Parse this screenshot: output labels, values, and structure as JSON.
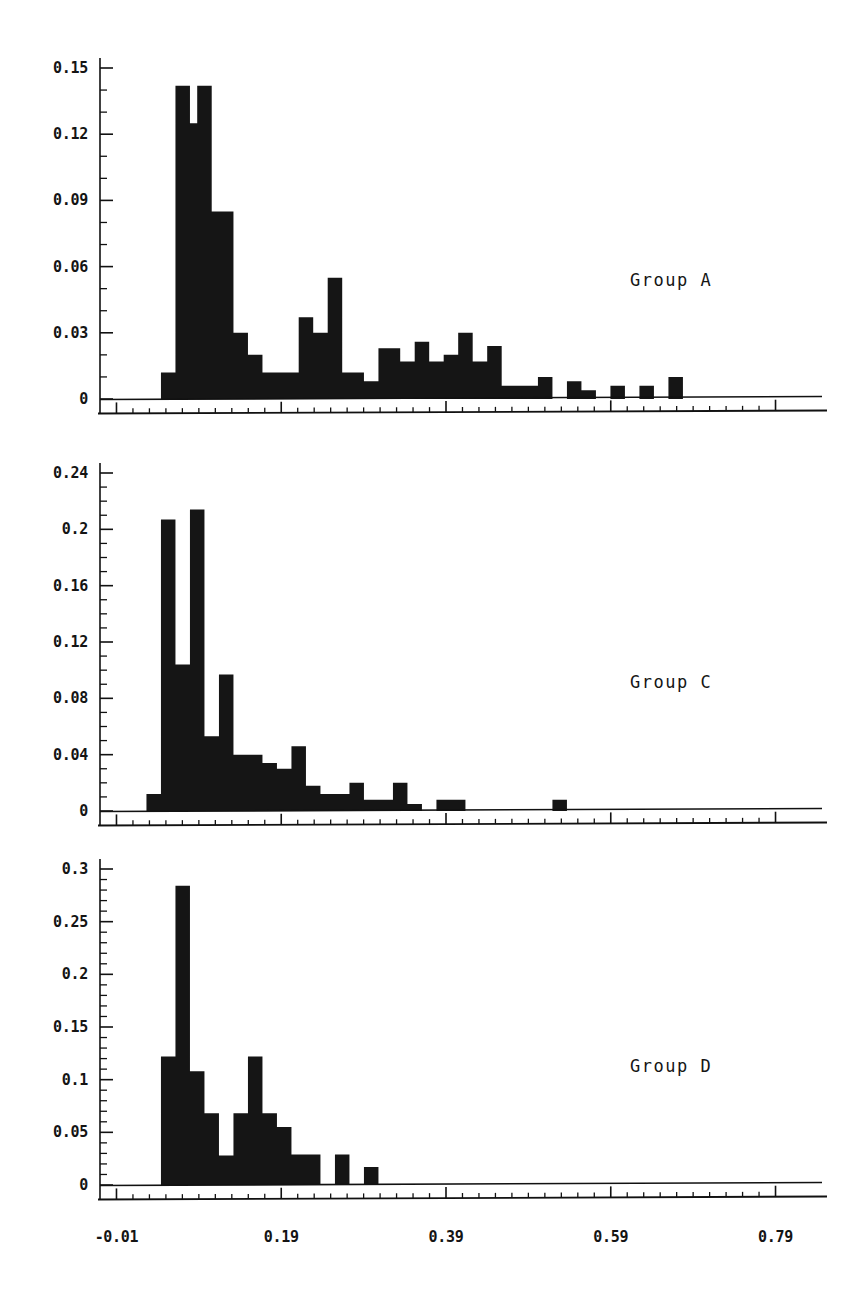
{
  "figure": {
    "title": "",
    "background": "#ffffff",
    "ink_color": "#151515",
    "panel_count": 3
  },
  "xaxis": {
    "tick_labels": [
      "-0.01",
      "0.19",
      "0.39",
      "0.59",
      "0.79"
    ],
    "tick_values": [
      -0.01,
      0.19,
      0.39,
      0.59,
      0.79
    ],
    "minor_step": 0.02,
    "range": [
      -0.03,
      0.81
    ],
    "label": ""
  },
  "panels": [
    {
      "name": "Group A",
      "group_label": "Group A",
      "ylabels": [
        "0.15",
        "0.12",
        "0.09",
        "0.06",
        "0.03",
        "0"
      ],
      "yvalues": [
        0.15,
        0.12,
        0.09,
        0.06,
        0.03,
        0
      ],
      "ylim": [
        0,
        0.158
      ],
      "minor_per_major": 3
    },
    {
      "name": "Group C",
      "group_label": "Group C",
      "ylabels": [
        "0.24",
        "0.2",
        "0.16",
        "0.12",
        "0.08",
        "0.04",
        "0"
      ],
      "yvalues": [
        0.24,
        0.2,
        0.16,
        0.12,
        0.08,
        0.04,
        0
      ],
      "ylim": [
        0,
        0.255
      ],
      "minor_per_major": 4
    },
    {
      "name": "Group D",
      "group_label": "Group D",
      "ylabels": [
        "0.3",
        "0.25",
        "0.2",
        "0.15",
        "0.1",
        "0.05",
        "0"
      ],
      "yvalues": [
        0.3,
        0.25,
        0.2,
        0.15,
        0.1,
        0.05,
        0
      ],
      "ylim": [
        0,
        0.315
      ],
      "minor_per_major": 5
    }
  ],
  "chart_data": [
    {
      "type": "bar",
      "title": "Group A",
      "xlabel": "",
      "ylabel": "",
      "xlim": [
        -0.03,
        0.81
      ],
      "ylim": [
        0,
        0.158
      ],
      "grid": false,
      "legend": "none",
      "annotation": "Group A",
      "bin_width": 0.0088,
      "bin_starts": [
        0.0088,
        0.0176,
        0.0264,
        0.0352,
        0.044,
        0.0528,
        0.0616,
        0.0704,
        0.0792,
        0.088,
        0.0968,
        0.1056,
        0.1144,
        0.1232,
        0.132,
        0.1408,
        0.1496,
        0.1584,
        0.1672,
        0.176,
        0.1848,
        0.1936,
        0.2024,
        0.2112,
        0.22,
        0.2288,
        0.2376,
        0.2464,
        0.2552,
        0.264,
        0.2728,
        0.2816,
        0.2904,
        0.2992,
        0.308,
        0.3168,
        0.3256,
        0.3344,
        0.3432,
        0.352,
        0.3608,
        0.3696,
        0.3784,
        0.3872,
        0.396,
        0.4048,
        0.4136,
        0.4224,
        0.4312,
        0.44,
        0.4488,
        0.4576,
        0.4664,
        0.4752,
        0.484,
        0.4928,
        0.5016,
        0.5104,
        0.5192,
        0.528,
        0.5368,
        0.5456,
        0.5544,
        0.5632,
        0.572,
        0.5808,
        0.5896,
        0.5984,
        0.6072,
        0.616,
        0.6248,
        0.6336,
        0.6424,
        0.6512,
        0.66,
        0.6688,
        0.6776,
        0.6864,
        0.6952,
        0.704,
        0.7128,
        0.7216,
        0.7304,
        0.7392
      ],
      "values": [
        0.0,
        0.0,
        0.0,
        0.0,
        0.012,
        0.012,
        0.142,
        0.142,
        0.125,
        0.142,
        0.142,
        0.085,
        0.085,
        0.085,
        0.03,
        0.03,
        0.02,
        0.02,
        0.012,
        0.012,
        0.012,
        0.012,
        0.012,
        0.037,
        0.037,
        0.03,
        0.03,
        0.055,
        0.055,
        0.012,
        0.012,
        0.012,
        0.008,
        0.008,
        0.023,
        0.023,
        0.023,
        0.017,
        0.017,
        0.026,
        0.026,
        0.017,
        0.017,
        0.02,
        0.02,
        0.03,
        0.03,
        0.017,
        0.017,
        0.024,
        0.024,
        0.006,
        0.006,
        0.006,
        0.006,
        0.006,
        0.01,
        0.01,
        0.0,
        0.0,
        0.008,
        0.008,
        0.004,
        0.004,
        0.0,
        0.0,
        0.006,
        0.006,
        0.0,
        0.0,
        0.006,
        0.006,
        0.0,
        0.0,
        0.01,
        0.01,
        0.0,
        0.0,
        0.0,
        0.0,
        0.0,
        0.0,
        0.0,
        0.0
      ]
    },
    {
      "type": "bar",
      "title": "Group C",
      "xlabel": "",
      "ylabel": "",
      "xlim": [
        -0.03,
        0.81
      ],
      "ylim": [
        0,
        0.255
      ],
      "grid": false,
      "legend": "none",
      "annotation": "Group C",
      "bin_width": 0.0088,
      "bin_starts": [
        0.0088,
        0.0176,
        0.0264,
        0.0352,
        0.044,
        0.0528,
        0.0616,
        0.0704,
        0.0792,
        0.088,
        0.0968,
        0.1056,
        0.1144,
        0.1232,
        0.132,
        0.1408,
        0.1496,
        0.1584,
        0.1672,
        0.176,
        0.1848,
        0.1936,
        0.2024,
        0.2112,
        0.22,
        0.2288,
        0.2376,
        0.2464,
        0.2552,
        0.264,
        0.2728,
        0.2816,
        0.2904,
        0.2992,
        0.308,
        0.3168,
        0.3256,
        0.3344,
        0.3432,
        0.352,
        0.3608,
        0.3696,
        0.3784,
        0.3872,
        0.396,
        0.4048,
        0.4136,
        0.4224,
        0.4312,
        0.44,
        0.4488,
        0.4576,
        0.4664,
        0.4752,
        0.484,
        0.4928,
        0.5016,
        0.5104,
        0.5192,
        0.528,
        0.5368,
        0.5456,
        0.5544,
        0.5632,
        0.572,
        0.5808,
        0.5896,
        0.5984,
        0.6072,
        0.616,
        0.6248,
        0.6336,
        0.6424,
        0.6512,
        0.66,
        0.6688,
        0.6776,
        0.6864,
        0.6952,
        0.704,
        0.7128,
        0.7216,
        0.7304,
        0.7392
      ],
      "values": [
        0.0,
        0.0,
        0.012,
        0.012,
        0.207,
        0.207,
        0.104,
        0.104,
        0.214,
        0.214,
        0.053,
        0.053,
        0.097,
        0.097,
        0.04,
        0.04,
        0.04,
        0.04,
        0.034,
        0.034,
        0.03,
        0.03,
        0.046,
        0.046,
        0.018,
        0.018,
        0.012,
        0.012,
        0.012,
        0.012,
        0.02,
        0.02,
        0.008,
        0.008,
        0.008,
        0.008,
        0.02,
        0.02,
        0.005,
        0.005,
        0.0,
        0.0,
        0.008,
        0.008,
        0.008,
        0.008,
        0.0,
        0.0,
        0.0,
        0.0,
        0.0,
        0.0,
        0.0,
        0.0,
        0.0,
        0.0,
        0.0,
        0.0,
        0.008,
        0.008,
        0.0,
        0.0,
        0.0,
        0.0,
        0.0,
        0.0,
        0.0,
        0.0,
        0.0,
        0.0,
        0.0,
        0.0,
        0.0,
        0.0,
        0.0,
        0.0,
        0.0,
        0.0,
        0.0,
        0.0,
        0.0,
        0.0,
        0.0,
        0.0
      ]
    },
    {
      "type": "bar",
      "title": "Group D",
      "xlabel": "",
      "ylabel": "",
      "xlim": [
        -0.03,
        0.81
      ],
      "ylim": [
        0,
        0.315
      ],
      "grid": false,
      "legend": "none",
      "annotation": "Group D",
      "bin_width": 0.0088,
      "bin_starts": [
        0.0088,
        0.0176,
        0.0264,
        0.0352,
        0.044,
        0.0528,
        0.0616,
        0.0704,
        0.0792,
        0.088,
        0.0968,
        0.1056,
        0.1144,
        0.1232,
        0.132,
        0.1408,
        0.1496,
        0.1584,
        0.1672,
        0.176,
        0.1848,
        0.1936,
        0.2024,
        0.2112,
        0.22,
        0.2288,
        0.2376,
        0.2464,
        0.2552,
        0.264,
        0.2728,
        0.2816,
        0.2904,
        0.2992,
        0.308,
        0.3168,
        0.3256,
        0.3344,
        0.3432,
        0.352,
        0.3608,
        0.3696,
        0.3784,
        0.3872,
        0.396,
        0.4048,
        0.4136,
        0.4224,
        0.4312,
        0.44,
        0.4488,
        0.4576,
        0.4664,
        0.4752,
        0.484,
        0.4928,
        0.5016,
        0.5104,
        0.5192,
        0.528,
        0.5368,
        0.5456,
        0.5544,
        0.5632,
        0.572,
        0.5808,
        0.5896,
        0.5984,
        0.6072,
        0.616,
        0.6248,
        0.6336,
        0.6424,
        0.6512,
        0.66,
        0.6688,
        0.6776,
        0.6864,
        0.6952,
        0.704,
        0.7128,
        0.7216,
        0.7304,
        0.7392
      ],
      "values": [
        0.0,
        0.0,
        0.0,
        0.0,
        0.122,
        0.122,
        0.284,
        0.284,
        0.108,
        0.108,
        0.068,
        0.068,
        0.028,
        0.028,
        0.068,
        0.068,
        0.122,
        0.122,
        0.068,
        0.068,
        0.055,
        0.055,
        0.029,
        0.029,
        0.029,
        0.029,
        0.0,
        0.0,
        0.029,
        0.029,
        0.0,
        0.0,
        0.017,
        0.017,
        0.0,
        0.0,
        0.0,
        0.0,
        0.0,
        0.0,
        0.0,
        0.0,
        0.0,
        0.0,
        0.0,
        0.0,
        0.0,
        0.0,
        0.0,
        0.0,
        0.0,
        0.0,
        0.0,
        0.0,
        0.0,
        0.0,
        0.0,
        0.0,
        0.0,
        0.0,
        0.0,
        0.0,
        0.0,
        0.0,
        0.0,
        0.0,
        0.0,
        0.0,
        0.0,
        0.0,
        0.0,
        0.0,
        0.0,
        0.0,
        0.0,
        0.0,
        0.0,
        0.0,
        0.0,
        0.0,
        0.0,
        0.0,
        0.0,
        0.0
      ]
    }
  ]
}
